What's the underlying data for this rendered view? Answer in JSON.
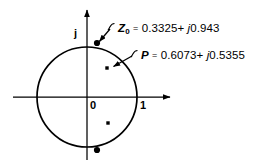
{
  "figure": {
    "type": "complex-plane-diagram",
    "background_color": "#ffffff",
    "ink_color": "#000000"
  },
  "axes": {
    "origin_label": "0",
    "real_tick_label": "1",
    "imaginary_axis_label": "j",
    "real_axis": {
      "x_start": 13,
      "x_end": 172,
      "y": 97,
      "arrow": "right"
    },
    "imaginary_axis": {
      "x": 87,
      "y_start": 8,
      "y_end": 160,
      "arrow": "up"
    }
  },
  "unit_circle": {
    "center_x": 87,
    "center_y": 97,
    "radius": 50,
    "stroke_width": 1.6
  },
  "markers": [
    {
      "name": "z0-dot",
      "shape": "filled-dot",
      "x": 97,
      "y": 43,
      "radius": 3.1
    },
    {
      "name": "bottom-dot",
      "shape": "filled-dot",
      "x": 97,
      "y": 150,
      "radius": 3.1
    },
    {
      "name": "p-cross-upper",
      "shape": "small-square",
      "x": 107,
      "y": 68,
      "size": 3.4
    },
    {
      "name": "cross-lower",
      "shape": "small-square",
      "x": 108,
      "y": 123,
      "size": 3.4
    }
  ],
  "annotations": {
    "z0": {
      "symbol": "Z",
      "subscript": "0",
      "equals": "=",
      "real": "0.3325",
      "plus": "+",
      "j": "j",
      "imag": "0.943",
      "full_text": "Z0 = 0.3325 + j0.943",
      "label_x": 116,
      "label_y": 25,
      "leader": {
        "from_x": 113,
        "from_y": 27,
        "to_x": 99,
        "to_y": 42
      }
    },
    "p": {
      "symbol": "P",
      "subscript": "",
      "equals": "=",
      "real": "0.6073",
      "plus": "+",
      "j": "j",
      "imag": "0.5355",
      "full_text": "P = 0.6073 + j0.5355",
      "label_x": 139,
      "label_y": 52,
      "leader": {
        "from_x": 136,
        "from_y": 54,
        "to_x": 113,
        "to_y": 66
      }
    }
  }
}
